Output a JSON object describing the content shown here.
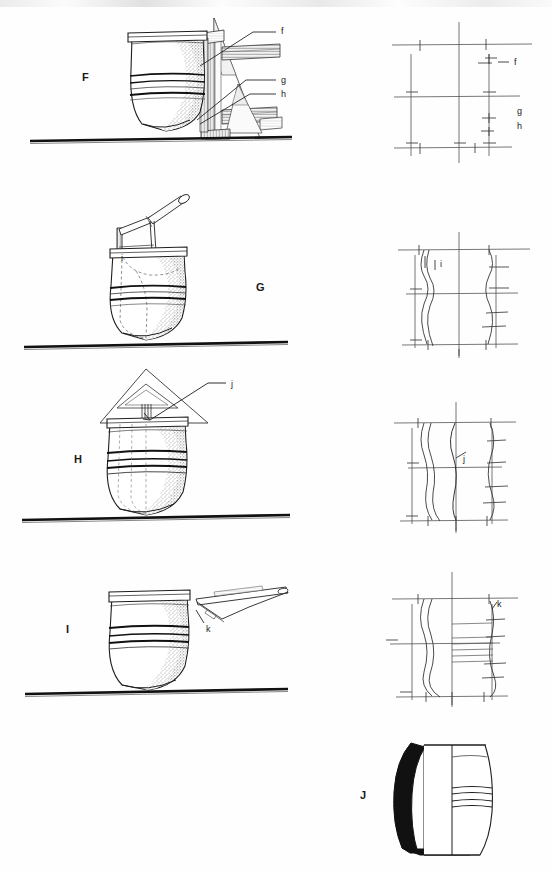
{
  "plate": {
    "background_color": "#fefefe",
    "ink_color": "#1a1a1a",
    "width": 552,
    "height": 872,
    "description": "Archaeological illustration plate: four pottery vessels (F, G, H, I) shown in side elevation with wooden tool/frame reconstructions at left, matched by schematic profile-construction diagrams at right; vessel J at bottom shown as half-section profile."
  },
  "figures": [
    {
      "id": "F",
      "label": "F",
      "label_x": 82,
      "label_y": 78,
      "ground_line_y": 140,
      "ground_line_x1": 30,
      "ground_line_x2": 292,
      "callouts": [
        {
          "label": "f",
          "x": 281,
          "y": 31
        },
        {
          "label": "g",
          "x": 281,
          "y": 80
        },
        {
          "label": "h",
          "x": 281,
          "y": 94
        }
      ],
      "right_panel_callouts": [
        {
          "label": "f",
          "x": 514,
          "y": 62
        },
        {
          "label": "g",
          "x": 517,
          "y": 111
        },
        {
          "label": "h",
          "x": 517,
          "y": 126
        }
      ]
    },
    {
      "id": "G",
      "label": "G",
      "label_x": 256,
      "label_y": 288,
      "ground_line_y": 345,
      "ground_line_x1": 24,
      "ground_line_x2": 288,
      "callouts": [
        {
          "label": "i",
          "x": 121,
          "y": 258
        }
      ],
      "right_panel_callouts": [
        {
          "label": "i",
          "x": 440,
          "y": 264
        }
      ]
    },
    {
      "id": "H",
      "label": "H",
      "label_x": 74,
      "label_y": 460,
      "ground_line_y": 518,
      "ground_line_x1": 22,
      "ground_line_x2": 290,
      "callouts": [
        {
          "label": "j",
          "x": 231,
          "y": 384
        }
      ],
      "right_panel_callouts": [
        {
          "label": "j",
          "x": 463,
          "y": 459
        }
      ]
    },
    {
      "id": "I",
      "label": "I",
      "label_x": 66,
      "label_y": 630,
      "ground_line_y": 692,
      "ground_line_x1": 25,
      "ground_line_x2": 288,
      "callouts": [
        {
          "label": "k",
          "x": 206,
          "y": 629
        }
      ],
      "right_panel_callouts": [
        {
          "label": "k",
          "x": 497,
          "y": 604
        }
      ]
    },
    {
      "id": "J",
      "label": "J",
      "label_x": 360,
      "label_y": 796,
      "ground_line_y": null,
      "callouts": [],
      "right_panel_callouts": []
    }
  ],
  "legend_letters": [
    "f",
    "g",
    "h",
    "i",
    "j",
    "k"
  ],
  "figure_letters": [
    "F",
    "G",
    "H",
    "I",
    "J"
  ]
}
